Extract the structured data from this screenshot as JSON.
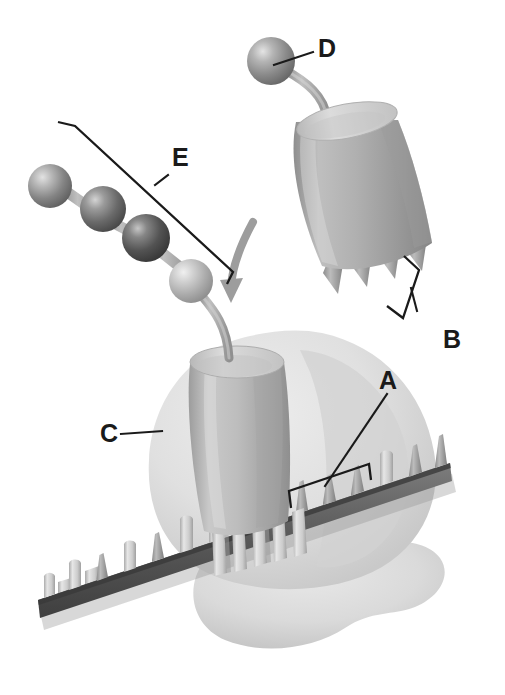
{
  "figure": {
    "background_color": "#ffffff",
    "width": 505,
    "height": 695
  },
  "labels": [
    {
      "id": "A",
      "text": "A",
      "x": 390,
      "y": 392,
      "annotation_type": "bracket-with-leader",
      "describes": "membrane-surface-spikes"
    },
    {
      "id": "B",
      "text": "B",
      "x": 455,
      "y": 340,
      "annotation_type": "bracket-with-leader",
      "describes": "detached-complex-cone-spikes"
    },
    {
      "id": "C",
      "text": "C",
      "x": 103,
      "y": 440,
      "annotation_type": "leader-line",
      "describes": "cytoplasmic-blob-body"
    },
    {
      "id": "D",
      "text": "D",
      "x": 322,
      "y": 52,
      "annotation_type": "leader-line",
      "describes": "terminal-sphere-subunit"
    },
    {
      "id": "E",
      "text": "E",
      "x": 168,
      "y": 165,
      "annotation_type": "bracket-with-leader",
      "describes": "sphere-chain-filament"
    }
  ],
  "parts": {
    "sphere_chain": {
      "name": "sphere-chain-filament",
      "count": 4,
      "sphere_colors": [
        "#8e8e8e",
        "#6e6e6e",
        "#555555",
        "#b4b4b4"
      ],
      "link_color": "#a9a9a9"
    },
    "terminal_sphere": {
      "name": "terminal-sphere-subunit",
      "color": "#919191"
    },
    "detached_complex": {
      "name": "detached-cylinder-complex",
      "body_color": "#a8a8a8",
      "top_color": "#c9c9c9",
      "spike_count": 4,
      "spike_color": "#9a9a9a"
    },
    "anchored_complex": {
      "name": "anchored-cylinder-complex",
      "body_color": "#b1b1b1",
      "top_color": "#cecece",
      "peg_count": 6,
      "peg_color": "#c8c8c8"
    },
    "blob": {
      "name": "cytoplasmic-blob-body",
      "color": "#dedede",
      "shadow_color": "#cbcbcb"
    },
    "membrane": {
      "name": "membrane-band",
      "band_color": "#6a6a6a",
      "edge_color": "#4d4d4d",
      "peg_color": "#cdcdcd",
      "peg_count": 14
    },
    "motion_arrow": {
      "name": "motion-arrow",
      "color": "#9b9b9b",
      "direction": "downward-curved"
    }
  }
}
